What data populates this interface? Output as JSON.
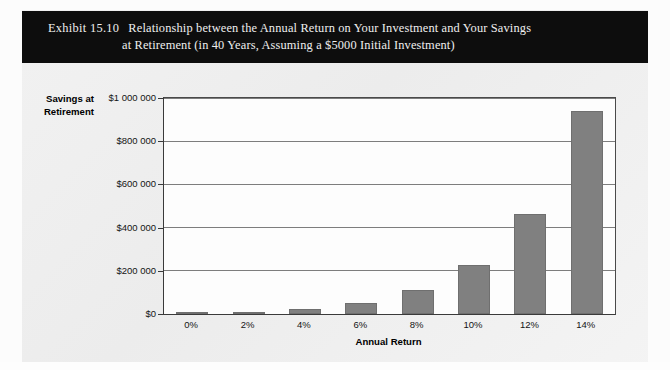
{
  "exhibit": {
    "label": "Exhibit 15.10",
    "title_line_1": "Relationship between the Annual Return on Your Investment and Your Savings",
    "title_line_2": "at Retirement (in 40 Years, Assuming a $5000 Initial Investment)",
    "banner_color": "#0d0d0d",
    "banner_text_color": "#efefef"
  },
  "chart_data": {
    "type": "bar",
    "title": "Relationship between the Annual Return on Your Investment and Your Savings at Retirement (in 40 Years, Assuming a $5000 Initial Investment)",
    "xlabel": "Annual Return",
    "ylabel": "Savings at Retirement",
    "ylabel_line_1": "Savings at",
    "ylabel_line_2": "Retirement",
    "categories": [
      "0%",
      "2%",
      "4%",
      "6%",
      "8%",
      "10%",
      "12%",
      "14%"
    ],
    "values": [
      5000,
      11000,
      24000,
      51000,
      109000,
      226000,
      462000,
      940000
    ],
    "ylim": [
      0,
      1000000
    ],
    "ytick_values": [
      0,
      200000,
      400000,
      600000,
      800000,
      1000000
    ],
    "ytick_labels": [
      "$0",
      "$200 000",
      "$400 000",
      "$600 000",
      "$800 000",
      "$1 000 000"
    ],
    "grid": true,
    "legend": false,
    "bar_color": "#808080",
    "plot_background": "#fdfdfd",
    "axis_color": "#3a3a3a"
  }
}
